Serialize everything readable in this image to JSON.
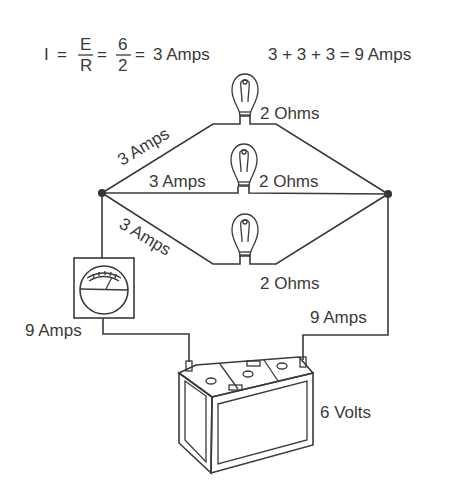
{
  "formulas": {
    "ohms_law": {
      "lhs": "I",
      "eq1": "=",
      "numerator": "E",
      "denominator": "R",
      "eq2": "=",
      "num_value": "6",
      "den_value": "2",
      "eq3": "=",
      "result": "3 Amps"
    },
    "sum": "3 + 3 + 3 = 9 Amps"
  },
  "branches": [
    {
      "current_label": "3 Amps",
      "resistance_label": "2 Ohms"
    },
    {
      "current_label": "3 Amps",
      "resistance_label": "2 Ohms"
    },
    {
      "current_label": "3 Amps",
      "resistance_label": "2 Ohms"
    }
  ],
  "ammeter": {
    "label": "9 Amps"
  },
  "return_wire": {
    "label": "9 Amps"
  },
  "battery": {
    "label": "6 Volts"
  },
  "colors": {
    "ink": "#3a3a3a",
    "background": "#ffffff"
  }
}
